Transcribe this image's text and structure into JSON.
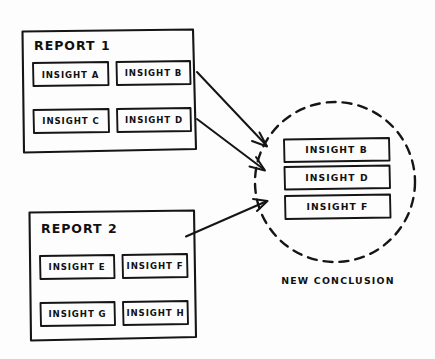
{
  "canvas": {
    "width": 435,
    "height": 359,
    "background_color": "#fdfdfd",
    "ink_color": "#151515",
    "style": "hand-drawn-marker-sketch"
  },
  "reports": [
    {
      "title": "REPORT 1",
      "insights": [
        {
          "label": "INSIGHT A"
        },
        {
          "label": "INSIGHT B"
        },
        {
          "label": "INSIGHT C"
        },
        {
          "label": "INSIGHT D"
        }
      ]
    },
    {
      "title": "REPORT 2",
      "insights": [
        {
          "label": "INSIGHT E"
        },
        {
          "label": "INSIGHT F"
        },
        {
          "label": "INSIGHT G"
        },
        {
          "label": "INSIGHT H"
        }
      ]
    }
  ],
  "conclusion": {
    "caption": "NEW CONCLUSION",
    "insights": [
      {
        "label": "INSIGHT B"
      },
      {
        "label": "INSIGHT D"
      },
      {
        "label": "INSIGHT F"
      }
    ]
  }
}
